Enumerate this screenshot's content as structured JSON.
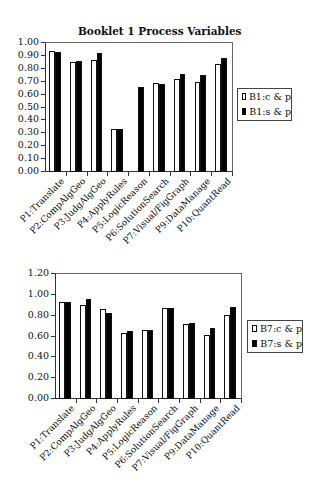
{
  "chart_data": [
    {
      "type": "bar",
      "title": "Booklet 1 Process Variables",
      "xlabel": "",
      "ylabel": "",
      "ylim": [
        0,
        1.0
      ],
      "yticks": [
        "0.00",
        "0.10",
        "0.20",
        "0.30",
        "0.40",
        "0.50",
        "0.60",
        "0.70",
        "0.80",
        "0.90",
        "1.00"
      ],
      "categories": [
        "P1:Translate",
        "P2:CompAlgGeo",
        "P3:JudgAlgGeo",
        "P4:ApplyRules",
        "P5:LogicReason",
        "P6:SolutionSearch",
        "P7:Visual/FigGraph",
        "P9:DataManage",
        "P10:QuantRead"
      ],
      "series": [
        {
          "name": "B1:c & p",
          "color": "#ffffff",
          "values": [
            0.94,
            0.85,
            0.87,
            0.33,
            null,
            0.69,
            0.72,
            0.7,
            0.84
          ]
        },
        {
          "name": "B1:s & p",
          "color": "#000000",
          "values": [
            0.93,
            0.86,
            0.92,
            0.33,
            0.66,
            0.68,
            0.76,
            0.75,
            0.88
          ]
        }
      ],
      "legend_position": "right",
      "grid": false
    },
    {
      "type": "bar",
      "title": "",
      "xlabel": "",
      "ylabel": "",
      "ylim": [
        0,
        1.2
      ],
      "yticks": [
        "0.00",
        "0.20",
        "0.40",
        "0.60",
        "0.80",
        "1.00",
        "1.20"
      ],
      "categories": [
        "P1:Translate",
        "P2:CompAlgGeo",
        "P3:JudgAlgGeo",
        "P4:ApplyRules",
        "P5:LogicReason",
        "P6:SolutionSearch",
        "P7:Visual/FigGraph",
        "P9:DataManage",
        "P10:QuantRead"
      ],
      "series": [
        {
          "name": "B7:c & p",
          "color": "#ffffff",
          "values": [
            0.93,
            0.9,
            0.86,
            0.63,
            0.66,
            0.87,
            0.72,
            0.61,
            0.81
          ]
        },
        {
          "name": "B7:s & p",
          "color": "#000000",
          "values": [
            0.93,
            0.96,
            0.83,
            0.65,
            0.66,
            0.87,
            0.73,
            0.68,
            0.88
          ]
        }
      ],
      "legend_position": "right",
      "grid": false
    }
  ]
}
